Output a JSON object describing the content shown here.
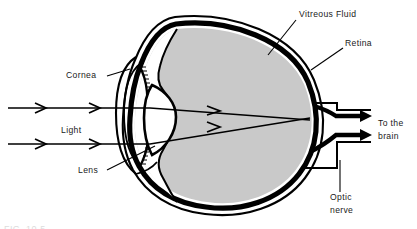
{
  "figure": {
    "width": 417,
    "height": 229,
    "background_color": "#ffffff",
    "caption_partial": "FIG. 10-5"
  },
  "colors": {
    "outline": "#000000",
    "retina_layer": "#000000",
    "vitreous_fill": "#c9c9c9",
    "sclera_fill": "#ffffff",
    "lens_fill": "#ffffff",
    "label_text": "#1a1a1a",
    "background": "#ffffff"
  },
  "labels": [
    {
      "id": "vitreous-fluid",
      "text": "Vitreous Fluid",
      "lines": [
        "Vitreous Fluid"
      ],
      "x": 299,
      "y": 17,
      "anchor": "start",
      "leader": {
        "x1": 296,
        "y1": 20,
        "x2": 268,
        "y2": 55
      }
    },
    {
      "id": "retina",
      "text": "Retina",
      "lines": [
        "Retina"
      ],
      "x": 345,
      "y": 46,
      "anchor": "start",
      "leader": {
        "x1": 343,
        "y1": 48,
        "x2": 311,
        "y2": 70
      }
    },
    {
      "id": "cornea",
      "text": "Cornea",
      "lines": [
        "Cornea"
      ],
      "x": 66,
      "y": 78,
      "anchor": "start",
      "leader": {
        "x1": 107,
        "y1": 76,
        "x2": 130,
        "y2": 69
      }
    },
    {
      "id": "light",
      "text": "Light",
      "lines": [
        "Light"
      ],
      "x": 61,
      "y": 133,
      "anchor": "start",
      "leader": null
    },
    {
      "id": "lens",
      "text": "Lens",
      "lines": [
        "Lens"
      ],
      "x": 78,
      "y": 173,
      "anchor": "start",
      "leader": {
        "x1": 107,
        "y1": 170,
        "x2": 155,
        "y2": 146
      }
    },
    {
      "id": "optic-nerve",
      "text": "Optic nerve",
      "lines": [
        "Optic",
        "nerve"
      ],
      "x": 330,
      "y": 200,
      "anchor": "start",
      "leader": {
        "x1": 340,
        "y1": 192,
        "x2": 340,
        "y2": 160
      }
    },
    {
      "id": "to-the-brain",
      "text": "To the brain",
      "lines": [
        "To the",
        "brain"
      ],
      "x": 378,
      "y": 126,
      "anchor": "start",
      "leader": null
    }
  ],
  "light_rays": [
    {
      "id": "upper-ray",
      "description": "Upper horizontal light ray entering cornea and converging on retina",
      "entry_y": 108,
      "exit_y": 120
    },
    {
      "id": "lower-ray",
      "description": "Lower horizontal light ray entering cornea and converging on retina",
      "entry_y": 144,
      "exit_y": 118
    }
  ],
  "nerve_arrows": [
    {
      "id": "nerve-arrow-upper",
      "y": 115
    },
    {
      "id": "nerve-arrow-lower",
      "y": 134
    }
  ],
  "structures": [
    {
      "id": "sclera",
      "name": "Sclera outer wall"
    },
    {
      "id": "retina-layer",
      "name": "Retina"
    },
    {
      "id": "vitreous-body",
      "name": "Vitreous fluid"
    },
    {
      "id": "cornea-arc",
      "name": "Cornea"
    },
    {
      "id": "lens-body",
      "name": "Lens"
    },
    {
      "id": "iris-upper",
      "name": "Upper iris / ciliary body"
    },
    {
      "id": "iris-lower",
      "name": "Lower iris / ciliary body"
    },
    {
      "id": "optic-nerve-tube",
      "name": "Optic nerve"
    }
  ]
}
